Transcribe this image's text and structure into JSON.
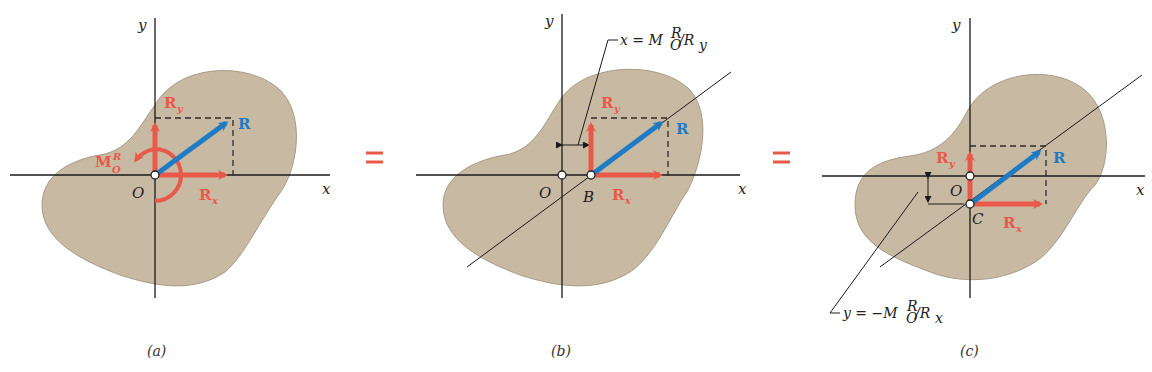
{
  "figure": {
    "colors": {
      "force_red": "#e8594a",
      "resultant_blue": "#1f7bc4",
      "body_fill": "#c8b9a3",
      "body_stroke": "#a89a84",
      "axis": "#1a1a1a"
    },
    "equals_sign": "=",
    "panels": [
      {
        "id": "a",
        "caption": "(a)",
        "axis_x_label": "x",
        "axis_y_label": "y",
        "origin_label": "O",
        "force_labels": {
          "R": "R",
          "Rx_main": "R",
          "Rx_sub": "x",
          "Ry_main": "R",
          "Ry_sub": "y"
        },
        "moment_label": {
          "main": "M",
          "sup": "R",
          "sub": "O"
        }
      },
      {
        "id": "b",
        "caption": "(b)",
        "axis_x_label": "x",
        "axis_y_label": "y",
        "origin_label": "O",
        "point_label": "B",
        "force_labels": {
          "R": "R",
          "Rx_main": "R",
          "Rx_sub": "x",
          "Ry_main": "R",
          "Ry_sub": "y"
        },
        "equation": {
          "lhs": "x = M",
          "sup": "R",
          "sub": "O",
          "rhs": "/R",
          "rhs_sub": "y"
        }
      },
      {
        "id": "c",
        "caption": "(c)",
        "axis_x_label": "x",
        "axis_y_label": "y",
        "origin_label": "O",
        "point_label": "C",
        "force_labels": {
          "R": "R",
          "Rx_main": "R",
          "Rx_sub": "x",
          "Ry_main": "R",
          "Ry_sub": "y"
        },
        "equation": {
          "lhs": "y = −M",
          "sup": "R",
          "sub": "O",
          "rhs": "/R",
          "rhs_sub": "x"
        }
      }
    ]
  }
}
